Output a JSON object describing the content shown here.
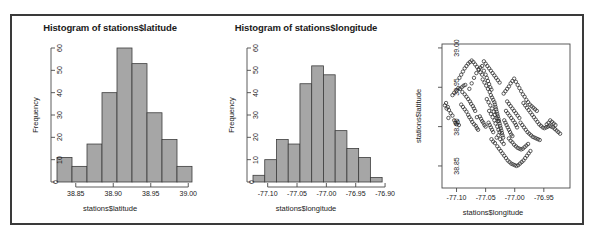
{
  "figure": {
    "panel_count": 3,
    "background": "#ffffff",
    "frame_color": "#3a3a3a"
  },
  "chart_data": [
    {
      "type": "bar",
      "id": "histogram-latitude",
      "title": "Histogram of stations$latitude",
      "xlabel": "stations$latitude",
      "ylabel": "Frequency",
      "xlim": [
        38.825,
        39.005
      ],
      "ylim": [
        0,
        60
      ],
      "xticks": [
        "38.85",
        "38.90",
        "38.95",
        "39.00"
      ],
      "xtick_values": [
        38.85,
        38.9,
        38.95,
        39.0
      ],
      "yticks": [
        "0",
        "10",
        "20",
        "30",
        "40",
        "50",
        "60"
      ],
      "ytick_values": [
        0,
        10,
        20,
        30,
        40,
        50,
        60
      ],
      "bin_width": 0.02,
      "bin_edges": [
        38.825,
        38.845,
        38.865,
        38.885,
        38.905,
        38.925,
        38.945,
        38.965,
        38.985,
        39.005
      ],
      "categories": [
        "38.825-38.845",
        "38.845-38.865",
        "38.865-38.885",
        "38.885-38.905",
        "38.905-38.925",
        "38.925-38.945",
        "38.945-38.965",
        "38.965-38.985",
        "38.985-39.005"
      ],
      "values": [
        11,
        7,
        17,
        40,
        60,
        53,
        31,
        19,
        7
      ],
      "grid": false,
      "bar_fill": "#a6a6a6",
      "bar_stroke": "#3c3c3c"
    },
    {
      "type": "bar",
      "id": "histogram-longitude",
      "title": "Histogram of stations$longitude",
      "xlabel": "stations$longitude",
      "ylabel": "Frequency",
      "xlim": [
        -77.125,
        -76.895
      ],
      "ylim": [
        0,
        60
      ],
      "xticks": [
        "-77.10",
        "-77.05",
        "-77.00",
        "-76.95",
        "-76.90"
      ],
      "xtick_values": [
        -77.1,
        -77.05,
        -77.0,
        -76.95,
        -76.9
      ],
      "yticks": [
        "0",
        "10",
        "20",
        "30",
        "40",
        "50",
        "60"
      ],
      "ytick_values": [
        0,
        10,
        20,
        30,
        40,
        50,
        60
      ],
      "bin_width": 0.02,
      "bin_edges": [
        -77.125,
        -77.105,
        -77.085,
        -77.065,
        -77.045,
        -77.025,
        -77.005,
        -76.985,
        -76.965,
        -76.945,
        -76.925,
        -76.905
      ],
      "categories": [
        "-77.125--77.105",
        "-77.105--77.085",
        "-77.085--77.065",
        "-77.065--77.045",
        "-77.045--77.025",
        "-77.025--77.005",
        "-77.005--76.985",
        "-76.985--76.965",
        "-76.965--76.945",
        "-76.945--76.925",
        "-76.925--76.905"
      ],
      "values": [
        3,
        10,
        19,
        17,
        44,
        52,
        48,
        23,
        15,
        11,
        2
      ],
      "grid": false,
      "bar_fill": "#a6a6a6",
      "bar_stroke": "#3c3c3c"
    },
    {
      "type": "scatter",
      "id": "scatter-lon-lat",
      "title": "",
      "xlabel": "stations$longitude",
      "ylabel": "stations$latitude",
      "xlim": [
        -77.125,
        -76.905
      ],
      "ylim": [
        38.822,
        39.005
      ],
      "xticks": [
        "-77.10",
        "-77.05",
        "-77.00",
        "-76.95"
      ],
      "xtick_values": [
        -77.1,
        -77.05,
        -77.0,
        -76.95
      ],
      "yticks": [
        "38.85",
        "38.90",
        "38.95",
        "39.00"
      ],
      "ytick_values": [
        38.85,
        38.9,
        38.95,
        39.0
      ],
      "grid": false,
      "marker": "open-circle",
      "marker_stroke": "#2b2b2b",
      "points": [
        [
          -77.115,
          38.925
        ],
        [
          -77.113,
          38.921
        ],
        [
          -77.11,
          38.917
        ],
        [
          -77.107,
          38.914
        ],
        [
          -77.104,
          38.908
        ],
        [
          -77.102,
          38.905
        ],
        [
          -77.1,
          38.903
        ],
        [
          -77.098,
          38.906
        ],
        [
          -77.096,
          38.902
        ],
        [
          -77.107,
          38.94
        ],
        [
          -77.104,
          38.943
        ],
        [
          -77.1,
          38.946
        ],
        [
          -77.097,
          38.949
        ],
        [
          -77.094,
          38.948
        ],
        [
          -77.091,
          38.95
        ],
        [
          -77.088,
          38.952
        ],
        [
          -77.085,
          38.953
        ],
        [
          -77.09,
          38.944
        ],
        [
          -77.086,
          38.941
        ],
        [
          -77.083,
          38.938
        ],
        [
          -77.08,
          38.935
        ],
        [
          -77.077,
          38.932
        ],
        [
          -77.075,
          38.929
        ],
        [
          -77.072,
          38.926
        ],
        [
          -77.07,
          38.923
        ],
        [
          -77.068,
          38.92
        ],
        [
          -77.092,
          38.928
        ],
        [
          -77.089,
          38.925
        ],
        [
          -77.086,
          38.922
        ],
        [
          -77.083,
          38.919
        ],
        [
          -77.08,
          38.915
        ],
        [
          -77.078,
          38.912
        ],
        [
          -77.075,
          38.909
        ],
        [
          -77.073,
          38.906
        ],
        [
          -77.07,
          38.903
        ],
        [
          -77.067,
          38.901
        ],
        [
          -77.065,
          38.898
        ],
        [
          -77.063,
          38.896
        ],
        [
          -77.078,
          38.948
        ],
        [
          -77.074,
          38.955
        ],
        [
          -77.07,
          38.962
        ],
        [
          -77.066,
          38.968
        ],
        [
          -77.062,
          38.972
        ],
        [
          -77.059,
          38.975
        ],
        [
          -77.056,
          38.977
        ],
        [
          -77.053,
          38.971
        ],
        [
          -77.05,
          38.966
        ],
        [
          -77.048,
          38.962
        ],
        [
          -77.046,
          38.958
        ],
        [
          -77.044,
          38.954
        ],
        [
          -77.042,
          38.95
        ],
        [
          -77.04,
          38.947
        ],
        [
          -77.055,
          38.96
        ],
        [
          -77.052,
          38.956
        ],
        [
          -77.049,
          38.952
        ],
        [
          -77.046,
          38.948
        ],
        [
          -77.043,
          38.944
        ],
        [
          -77.041,
          38.94
        ],
        [
          -77.039,
          38.937
        ],
        [
          -77.037,
          38.934
        ],
        [
          -77.035,
          38.931
        ],
        [
          -77.034,
          38.928
        ],
        [
          -77.033,
          38.925
        ],
        [
          -77.032,
          38.922
        ],
        [
          -77.031,
          38.919
        ],
        [
          -77.03,
          38.916
        ],
        [
          -77.029,
          38.913
        ],
        [
          -77.028,
          38.91
        ],
        [
          -77.027,
          38.907
        ],
        [
          -77.026,
          38.904
        ],
        [
          -77.025,
          38.901
        ],
        [
          -77.024,
          38.898
        ],
        [
          -77.023,
          38.895
        ],
        [
          -77.022,
          38.892
        ],
        [
          -77.021,
          38.889
        ],
        [
          -77.02,
          38.886
        ],
        [
          -77.048,
          38.935
        ],
        [
          -77.045,
          38.931
        ],
        [
          -77.042,
          38.927
        ],
        [
          -77.039,
          38.923
        ],
        [
          -77.036,
          38.919
        ],
        [
          -77.034,
          38.915
        ],
        [
          -77.031,
          38.911
        ],
        [
          -77.029,
          38.907
        ],
        [
          -77.044,
          38.92
        ],
        [
          -77.041,
          38.916
        ],
        [
          -77.038,
          38.912
        ],
        [
          -77.035,
          38.908
        ],
        [
          -77.033,
          38.904
        ],
        [
          -77.03,
          38.9
        ],
        [
          -77.028,
          38.896
        ],
        [
          -77.026,
          38.893
        ],
        [
          -77.018,
          38.908
        ],
        [
          -77.016,
          38.905
        ],
        [
          -77.014,
          38.902
        ],
        [
          -77.012,
          38.899
        ],
        [
          -77.01,
          38.896
        ],
        [
          -77.008,
          38.893
        ],
        [
          -77.006,
          38.89
        ],
        [
          -77.004,
          38.888
        ],
        [
          -77.015,
          38.92
        ],
        [
          -77.012,
          38.917
        ],
        [
          -77.009,
          38.914
        ],
        [
          -77.006,
          38.911
        ],
        [
          -77.003,
          38.908
        ],
        [
          -77.0,
          38.905
        ],
        [
          -76.998,
          38.902
        ],
        [
          -76.996,
          38.899
        ],
        [
          -77.013,
          38.932
        ],
        [
          -77.01,
          38.929
        ],
        [
          -77.007,
          38.926
        ],
        [
          -77.004,
          38.923
        ],
        [
          -77.001,
          38.92
        ],
        [
          -76.998,
          38.917
        ],
        [
          -76.995,
          38.914
        ],
        [
          -76.992,
          38.911
        ],
        [
          -77.019,
          38.942
        ],
        [
          -77.016,
          38.945
        ],
        [
          -77.013,
          38.948
        ],
        [
          -77.01,
          38.951
        ],
        [
          -77.007,
          38.955
        ],
        [
          -77.004,
          38.958
        ],
        [
          -77.001,
          38.961
        ],
        [
          -76.998,
          38.957
        ],
        [
          -76.995,
          38.953
        ],
        [
          -76.992,
          38.949
        ],
        [
          -76.989,
          38.945
        ],
        [
          -76.986,
          38.941
        ],
        [
          -76.983,
          38.938
        ],
        [
          -76.98,
          38.934
        ],
        [
          -76.977,
          38.931
        ],
        [
          -76.974,
          38.928
        ],
        [
          -76.971,
          38.926
        ],
        [
          -76.968,
          38.924
        ],
        [
          -76.965,
          38.922
        ],
        [
          -76.962,
          38.92
        ],
        [
          -76.985,
          38.93
        ],
        [
          -76.982,
          38.927
        ],
        [
          -76.979,
          38.924
        ],
        [
          -76.976,
          38.921
        ],
        [
          -76.973,
          38.918
        ],
        [
          -76.97,
          38.915
        ],
        [
          -76.967,
          38.912
        ],
        [
          -76.964,
          38.909
        ],
        [
          -76.961,
          38.906
        ],
        [
          -76.958,
          38.903
        ],
        [
          -76.955,
          38.901
        ],
        [
          -76.952,
          38.899
        ],
        [
          -76.949,
          38.898
        ],
        [
          -76.946,
          38.899
        ],
        [
          -76.943,
          38.9
        ],
        [
          -76.94,
          38.901
        ],
        [
          -76.937,
          38.9
        ],
        [
          -76.934,
          38.899
        ],
        [
          -76.931,
          38.897
        ],
        [
          -76.928,
          38.895
        ],
        [
          -76.99,
          38.905
        ],
        [
          -76.987,
          38.902
        ],
        [
          -76.984,
          38.899
        ],
        [
          -76.981,
          38.896
        ],
        [
          -76.978,
          38.893
        ],
        [
          -76.975,
          38.891
        ],
        [
          -76.972,
          38.889
        ],
        [
          -76.969,
          38.887
        ],
        [
          -76.966,
          38.886
        ],
        [
          -76.963,
          38.885
        ],
        [
          -76.96,
          38.884
        ],
        [
          -76.957,
          38.883
        ],
        [
          -77.01,
          38.885
        ],
        [
          -77.007,
          38.882
        ],
        [
          -77.004,
          38.88
        ],
        [
          -77.001,
          38.877
        ],
        [
          -76.998,
          38.875
        ],
        [
          -76.995,
          38.873
        ],
        [
          -76.992,
          38.872
        ],
        [
          -76.989,
          38.871
        ],
        [
          -76.986,
          38.872
        ],
        [
          -76.983,
          38.874
        ],
        [
          -76.98,
          38.876
        ],
        [
          -76.977,
          38.878
        ],
        [
          -77.03,
          38.875
        ],
        [
          -77.027,
          38.872
        ],
        [
          -77.024,
          38.869
        ],
        [
          -77.021,
          38.866
        ],
        [
          -77.018,
          38.863
        ],
        [
          -77.015,
          38.86
        ],
        [
          -77.012,
          38.857
        ],
        [
          -77.009,
          38.855
        ],
        [
          -77.006,
          38.853
        ],
        [
          -77.003,
          38.852
        ],
        [
          -77.0,
          38.851
        ],
        [
          -76.997,
          38.85
        ],
        [
          -76.994,
          38.851
        ],
        [
          -76.991,
          38.853
        ],
        [
          -76.988,
          38.855
        ],
        [
          -76.985,
          38.857
        ],
        [
          -76.982,
          38.86
        ],
        [
          -76.979,
          38.863
        ],
        [
          -76.976,
          38.866
        ],
        [
          -76.973,
          38.869
        ],
        [
          -77.04,
          38.884
        ],
        [
          -77.037,
          38.881
        ],
        [
          -77.034,
          38.879
        ],
        [
          -77.031,
          38.886
        ],
        [
          -77.028,
          38.889
        ],
        [
          -77.025,
          38.884
        ],
        [
          -77.022,
          38.881
        ],
        [
          -77.019,
          38.878
        ],
        [
          -77.045,
          38.905
        ],
        [
          -77.043,
          38.902
        ],
        [
          -77.041,
          38.899
        ],
        [
          -77.039,
          38.896
        ],
        [
          -77.037,
          38.893
        ],
        [
          -77.06,
          38.913
        ],
        [
          -77.058,
          38.91
        ],
        [
          -77.056,
          38.907
        ],
        [
          -77.054,
          38.905
        ],
        [
          -77.052,
          38.902
        ],
        [
          -77.05,
          38.9
        ],
        [
          -77.065,
          38.912
        ],
        [
          -77.095,
          38.962
        ],
        [
          -77.092,
          38.966
        ],
        [
          -77.089,
          38.97
        ],
        [
          -77.086,
          38.974
        ],
        [
          -77.083,
          38.977
        ],
        [
          -77.08,
          38.98
        ],
        [
          -77.077,
          38.982
        ],
        [
          -77.074,
          38.984
        ],
        [
          -77.071,
          38.982
        ],
        [
          -77.068,
          38.979
        ],
        [
          -77.065,
          38.976
        ],
        [
          -77.062,
          38.973
        ],
        [
          -77.059,
          38.969
        ],
        [
          -77.056,
          38.966
        ],
        [
          -77.053,
          38.983
        ],
        [
          -77.05,
          38.98
        ],
        [
          -77.047,
          38.977
        ],
        [
          -77.044,
          38.974
        ],
        [
          -77.041,
          38.971
        ],
        [
          -77.038,
          38.968
        ],
        [
          -77.035,
          38.965
        ],
        [
          -77.032,
          38.962
        ],
        [
          -77.029,
          38.959
        ],
        [
          -77.026,
          38.956
        ],
        [
          -77.118,
          38.93
        ],
        [
          -77.12,
          38.927
        ],
        [
          -77.117,
          38.923
        ],
        [
          -77.114,
          38.911
        ],
        [
          -76.925,
          38.893
        ],
        [
          -76.922,
          38.891
        ],
        [
          -76.93,
          38.902
        ],
        [
          -76.933,
          38.904
        ],
        [
          -76.936,
          38.906
        ],
        [
          -76.939,
          38.908
        ],
        [
          -76.942,
          38.905
        ],
        [
          -76.945,
          38.903
        ]
      ]
    }
  ]
}
